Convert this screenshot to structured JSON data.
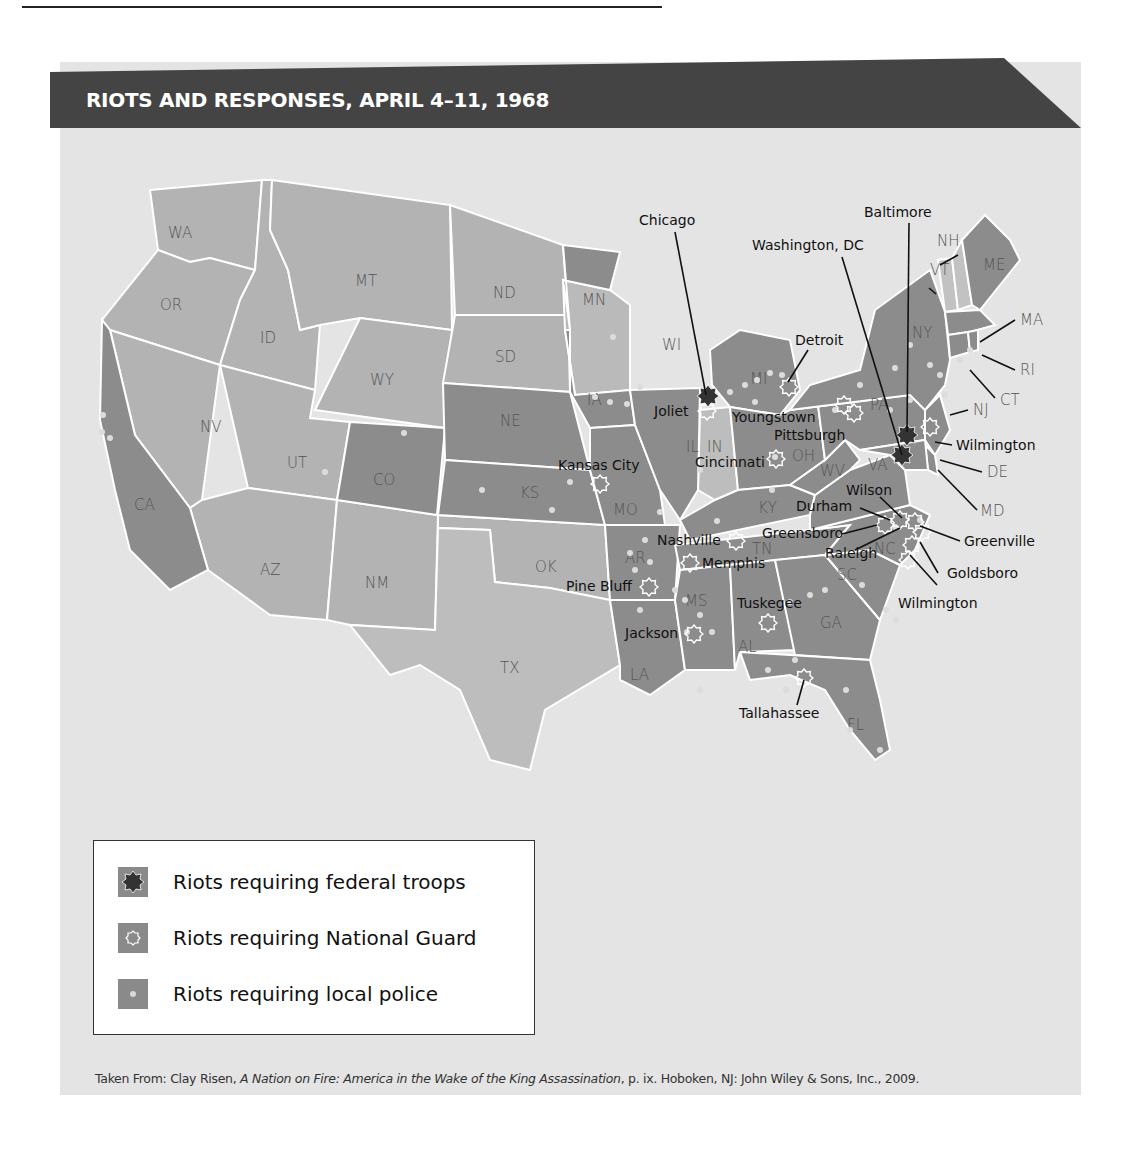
{
  "header": {
    "title": "RIOTS AND RESPONSES, APRIL 4–11, 1968"
  },
  "colors": {
    "banner": "#444444",
    "background": "#e4e4e4",
    "state_local_police": "#8c8c8c",
    "state_light": "#b0b0b0",
    "state_lighter": "#bdbdbd",
    "federal_marker": "#333333",
    "guard_marker_outline": "#ffffff",
    "police_dot": "#d9d9d9"
  },
  "map": {
    "states": {
      "WA": "WA",
      "OR": "OR",
      "CA": "CA",
      "ID": "ID",
      "NV": "NV",
      "MT": "MT",
      "WY": "WY",
      "UT": "UT",
      "AZ": "AZ",
      "CO": "CO",
      "NM": "NM",
      "ND": "ND",
      "SD": "SD",
      "NE": "NE",
      "KS": "KS",
      "OK": "OK",
      "TX": "TX",
      "MN": "MN",
      "IA": "IA",
      "MO": "MO",
      "AR": "AR",
      "LA": "LA",
      "WI": "WI",
      "IL": "IL",
      "MI": "MI",
      "IN": "IN",
      "OH": "OH",
      "KY": "KY",
      "TN": "TN",
      "MS": "MS",
      "AL": "AL",
      "GA": "GA",
      "FL": "FL",
      "SC": "SC",
      "NC": "NC",
      "VA": "VA",
      "WV": "WV",
      "PA": "PA",
      "NY": "NY",
      "VT": "VT",
      "NH": "NH",
      "ME": "ME",
      "MA": "MA",
      "RI": "RI",
      "CT": "CT",
      "NJ": "NJ",
      "DE": "DE",
      "MD": "MD"
    },
    "cities_federal_troops": [
      "Chicago",
      "Washington, DC",
      "Baltimore"
    ],
    "cities_national_guard": [
      "Joliet",
      "Detroit",
      "Youngstown",
      "Pittsburgh",
      "Cincinnati",
      "Kansas City",
      "Nashville",
      "Memphis",
      "Pine Bluff",
      "Jackson",
      "Tuskegee",
      "Tallahassee",
      "Wilmington",
      "Durham",
      "Greensboro",
      "Raleigh",
      "Wilson",
      "Greenville",
      "Goldsboro",
      "Wilmington (NC)"
    ],
    "labels": {
      "chicago": "Chicago",
      "washington": "Washington, DC",
      "baltimore": "Baltimore",
      "detroit": "Detroit",
      "joliet": "Joliet",
      "youngstown": "Youngstown",
      "pittsburgh": "Pittsburgh",
      "cincinnati": "Cincinnati",
      "kansas_city": "Kansas City",
      "wilmington_de": "Wilmington",
      "wilson": "Wilson",
      "durham": "Durham",
      "greensboro": "Greensboro",
      "raleigh": "Raleigh",
      "greenville": "Greenville",
      "goldsboro": "Goldsboro",
      "wilmington_nc": "Wilmington",
      "nashville": "Nashville",
      "memphis": "Memphis",
      "pine_bluff": "Pine Bluff",
      "jackson": "Jackson",
      "tuskegee": "Tuskegee",
      "tallahassee": "Tallahassee"
    }
  },
  "legend": {
    "items": [
      {
        "icon": "federal-troops-star",
        "label": "Riots requiring federal troops"
      },
      {
        "icon": "national-guard-star-outline",
        "label": "Riots requiring National Guard"
      },
      {
        "icon": "local-police-dot",
        "label": "Riots requiring local police"
      }
    ]
  },
  "source": {
    "prefix": "Taken From: Clay Risen, ",
    "book_title": "A Nation on Fire: America in the Wake of the King Assassination",
    "suffix": ", p. ix. Hoboken, NJ: John Wiley & Sons, Inc., 2009."
  }
}
